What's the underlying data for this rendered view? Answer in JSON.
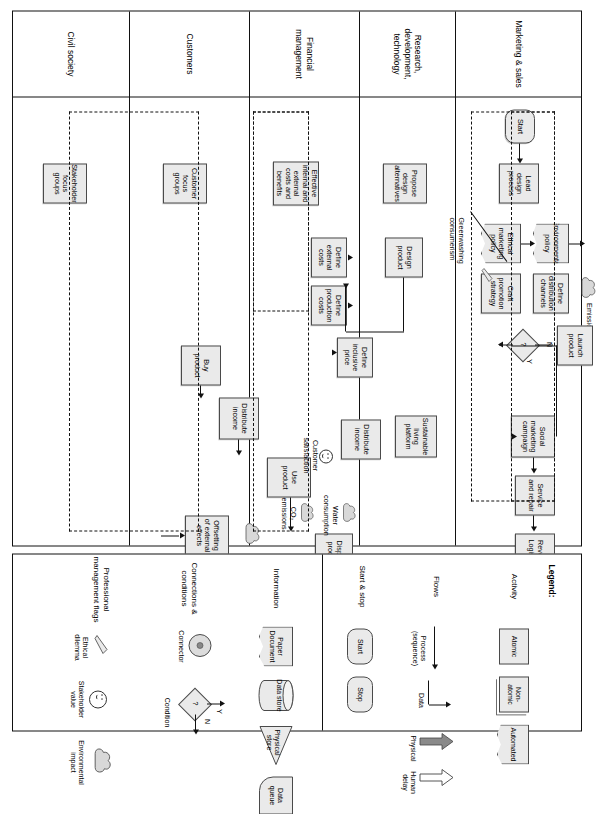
{
  "diagram": {
    "lanes": [
      {
        "id": "marketing",
        "label": "Marketing & sales"
      },
      {
        "id": "research",
        "label": "Research, development, technology"
      },
      {
        "id": "financial",
        "label": "Financial management"
      },
      {
        "id": "customers",
        "label": "Customers"
      },
      {
        "id": "civil",
        "label": "Civil society"
      }
    ],
    "nodes": {
      "start": "Start",
      "end": "End",
      "lead_design_process": "Lead design process",
      "environmental_policy": "Environmental policy",
      "ethical_marketing_policy": "Ethical marketing policy",
      "define_distribution_channels": "Define distribution channels",
      "craft_promotion_strategy": "Craft promotion strategy",
      "launch_product": "Launch product",
      "social_marketing_campaign": "Social marketing campaign",
      "service_and_repair": "Service and repair",
      "reverse_logistics": "Reverse Logistics",
      "propose_design_alternatives": "Propose design alternatives",
      "design_product": "Design product",
      "sustainable_living_platform": "Sustainable living platform",
      "effective_costs_benefits": "Effective internal and external costs and benefits",
      "define_external_costs": "Define external costs",
      "define_production_costs": "Define production costs",
      "define_inclusive_price": "Define inclusive price",
      "distribute_income_fin": "Distribute income",
      "distribute_income_cust": "Distribute income",
      "customer_focus_groups": "Customer focus groups",
      "buy_product": "Buy product",
      "use_product": "Use product",
      "dispose_product": "Dispose product",
      "stakeholder_focus_groups": "Stakeholder focus groups",
      "receive_donation_from_crm": "Receive donation from CRM",
      "offsetting_of_external_effects": "Offsetting of external effects"
    },
    "annotations": {
      "emissions": "Emissions",
      "greenwashing": "Greenwashing consumerism",
      "customer_satisfaction": "Customer satisfaction",
      "co2_emissions": "CO₂ emissions",
      "water_consumption": "Water consumption",
      "solid_waste": "Solid waste",
      "restored_environment": "Restored environment",
      "value_for_recipient": "Value for recipient",
      "decision_yes": "Y",
      "decision_no": "N",
      "decision_mark": "?"
    }
  },
  "legend": {
    "title": "Legend:",
    "categories": [
      {
        "name": "Activity",
        "items": [
          "Atomic",
          "Non-atomic",
          "Automated"
        ]
      },
      {
        "name": "Flows",
        "items": [
          "Process (sequence)",
          "Data",
          "Physical",
          "Human delay"
        ]
      },
      {
        "name": "Start & stop",
        "items": [
          "Start",
          "Stop"
        ]
      },
      {
        "name": "Information",
        "items": [
          "Paper Document",
          "Data store",
          "Physical store",
          "Data queue"
        ]
      },
      {
        "name": "Connections & conditions",
        "items": [
          "Connector",
          "Condition"
        ]
      },
      {
        "name": "Professional management flags",
        "items": [
          "Ethical dilemma",
          "Stakeholder value",
          "Environmental impact"
        ]
      }
    ],
    "condition_yes": "Y",
    "condition_no": "N",
    "condition_mark": "?"
  },
  "colors": {
    "node_fill": "#eaeaea",
    "node_border": "#4a4a4a",
    "line": "#111111",
    "physical_arrow": "#808080"
  }
}
